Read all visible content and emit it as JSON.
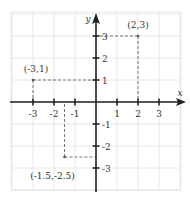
{
  "chart_data": {
    "type": "scatter",
    "title": "",
    "xlabel": "x",
    "ylabel": "y",
    "xlim": [
      -3.5,
      4
    ],
    "ylim": [
      -4,
      4
    ],
    "grid": true,
    "x_ticks": [
      -3,
      -2,
      -1,
      1,
      2,
      3
    ],
    "y_ticks": [
      3,
      2,
      1,
      -1,
      -2,
      -3
    ],
    "x_tick_labels": [
      "-3",
      "-2",
      "-1",
      "1",
      "2",
      "3"
    ],
    "y_tick_labels": [
      "3",
      "2",
      "1",
      "-1",
      "-2",
      "-3"
    ],
    "points": [
      {
        "x": 2,
        "y": 3,
        "label": "(2,3)"
      },
      {
        "x": -3,
        "y": 1,
        "label": "(-3,1)"
      },
      {
        "x": -1.5,
        "y": -2.5,
        "label": "(-1.5,-2.5)"
      }
    ],
    "projection_lines": "dashed"
  }
}
